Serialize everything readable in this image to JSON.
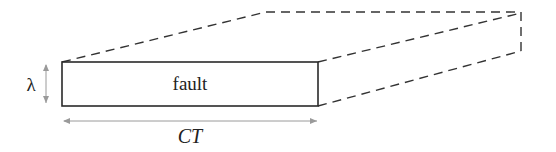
{
  "diagram": {
    "fault_label": "fault",
    "width_label": "CT",
    "height_label": "λ",
    "colors": {
      "stroke": "#2a2a2a",
      "dashed": "#333333",
      "arrow": "#9a9a9a",
      "text": "#222222",
      "background": "#ffffff"
    }
  }
}
